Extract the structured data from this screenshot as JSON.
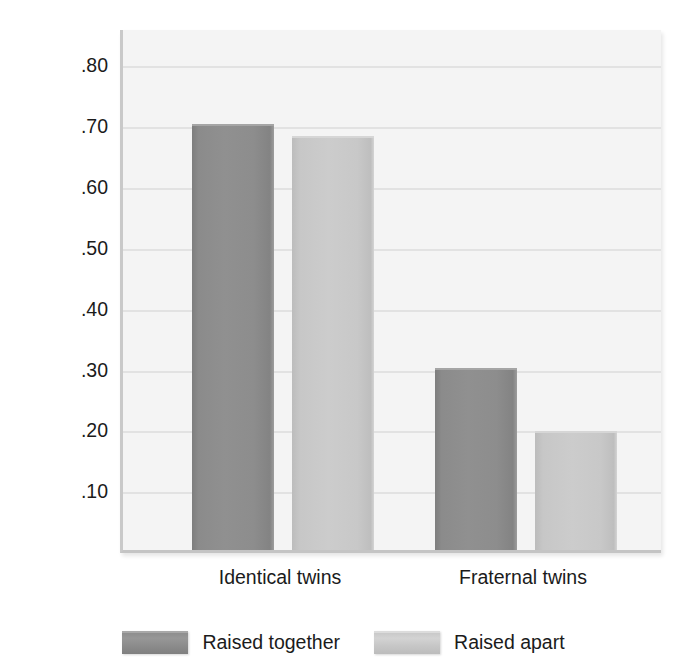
{
  "chart_data": {
    "type": "bar",
    "title": "",
    "subtitle": "",
    "xlabel": "",
    "ylabel": "Body mass index (BMI) correlations",
    "categories": [
      "Identical twins",
      "Fraternal twins"
    ],
    "series": [
      {
        "name": "Raised together",
        "values": [
          0.7,
          0.3
        ],
        "color": "#8d8d8d"
      },
      {
        "name": "Raised apart",
        "values": [
          0.68,
          0.195
        ],
        "color": "#c8c8c8"
      }
    ],
    "ylim": [
      0.0,
      0.86
    ],
    "ytick_values": [
      0.1,
      0.2,
      0.3,
      0.4,
      0.5,
      0.6,
      0.7,
      0.8
    ],
    "ytick_labels": [
      ".10",
      ".20",
      ".30",
      ".40",
      ".50",
      ".60",
      ".70",
      ".80"
    ],
    "grid": true,
    "grid_axis": "y",
    "legend_position": "bottom-center",
    "plot_background": "#f4f4f4",
    "page_background": "#ffffff",
    "gridline_color": "#e2e2e2",
    "axis_color": "#c6c6c6",
    "text_color": "#1b1b1b"
  },
  "axis": {
    "y_title": "Body mass index (BMI) correlations"
  },
  "legend": {
    "items": [
      {
        "label": "Raised together",
        "swatch": "dark-gray-swatch"
      },
      {
        "label": "Raised apart",
        "swatch": "light-gray-swatch"
      }
    ]
  }
}
